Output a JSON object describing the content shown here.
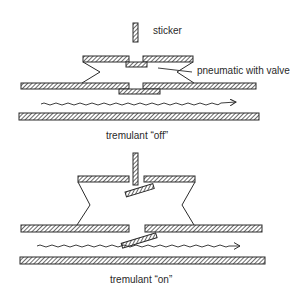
{
  "diagram": {
    "type": "mechanical cross-section",
    "colors": {
      "ink": "#2a2a2a",
      "background": "#ffffff"
    },
    "panels": [
      {
        "id": "off",
        "caption": "tremulant “off”",
        "labels": {
          "sticker": "sticker",
          "pneumatic": "pneumatic with valve"
        },
        "parts": [
          "sticker",
          "pneumatic-top-board",
          "pneumatic-bellows",
          "wind-trunk-upper-wall",
          "valve",
          "wind-trunk-lower-wall",
          "airflow-arrow"
        ]
      },
      {
        "id": "on",
        "caption": "tremulant “on”",
        "parts": [
          "sticker",
          "pneumatic-top-board",
          "tilted-upper-valve",
          "pneumatic-bellows",
          "wind-trunk-upper-wall",
          "tilted-lower-valve",
          "wind-trunk-lower-wall",
          "airflow-arrow"
        ]
      }
    ]
  }
}
